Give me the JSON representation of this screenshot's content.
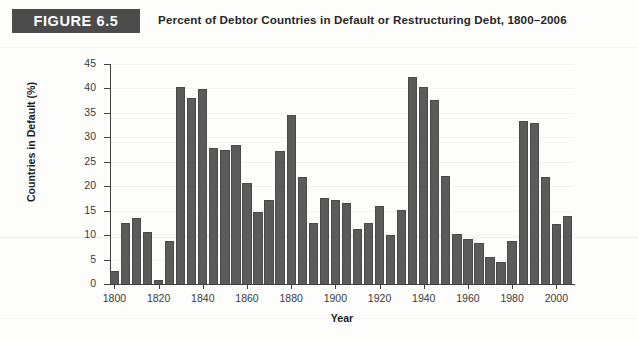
{
  "header": {
    "badge_label": "FIGURE 6.5",
    "title": "Percent of Debtor Countries in Default or Restructuring Debt, 1800–2006"
  },
  "colors": {
    "badge_background": "#4b4b4b",
    "badge_text": "#ffffff",
    "bar_fill": "#5b5b5b",
    "bar_edge": "#4a4a4a",
    "axis": "#404040",
    "gridline": "#f4f2f2",
    "page_background": "#fdfdfc"
  },
  "chart_data": {
    "type": "bar",
    "title": "Percent of Debtor Countries in Default or Restructuring Debt, 1800–2006",
    "xlabel": "Year",
    "ylabel": "Countries in Default (%)",
    "ylim": [
      0,
      45
    ],
    "xlim": [
      1798,
      2008
    ],
    "grid": true,
    "legend": null,
    "y_ticks": [
      0,
      5,
      10,
      15,
      20,
      25,
      30,
      35,
      40,
      45
    ],
    "x_ticks": [
      1800,
      1820,
      1840,
      1860,
      1880,
      1900,
      1920,
      1940,
      1960,
      1980,
      2000
    ],
    "bar_width_years": 4.2,
    "x": [
      1800,
      1805,
      1810,
      1815,
      1820,
      1825,
      1830,
      1835,
      1840,
      1845,
      1850,
      1855,
      1860,
      1865,
      1870,
      1875,
      1880,
      1885,
      1890,
      1895,
      1900,
      1905,
      1910,
      1915,
      1920,
      1925,
      1930,
      1935,
      1940,
      1945,
      1950,
      1955,
      1960,
      1965,
      1970,
      1975,
      1980,
      1985,
      1990,
      1995,
      2000,
      2005
    ],
    "values": [
      2.7,
      12.4,
      13.5,
      10.6,
      0.9,
      8.8,
      40.2,
      38.1,
      39.9,
      27.9,
      27.4,
      28.5,
      20.7,
      14.8,
      17.1,
      27.3,
      34.6,
      21.9,
      12.4,
      17.6,
      17.1,
      16.5,
      11.2,
      12.4,
      15.9,
      10.0,
      15.2,
      42.3,
      40.4,
      37.6,
      22.0,
      10.3,
      9.2,
      8.3,
      5.6,
      4.6,
      8.7,
      33.3,
      32.9,
      21.9,
      12.2,
      14.0
    ],
    "categories": [
      "1800",
      "1805",
      "1810",
      "1815",
      "1820",
      "1825",
      "1830",
      "1835",
      "1840",
      "1845",
      "1850",
      "1855",
      "1860",
      "1865",
      "1870",
      "1875",
      "1880",
      "1885",
      "1890",
      "1895",
      "1900",
      "1905",
      "1910",
      "1915",
      "1920",
      "1925",
      "1930",
      "1935",
      "1940",
      "1945",
      "1950",
      "1955",
      "1960",
      "1965",
      "1970",
      "1975",
      "1980",
      "1985",
      "1990",
      "1995",
      "2000",
      "2005"
    ]
  }
}
